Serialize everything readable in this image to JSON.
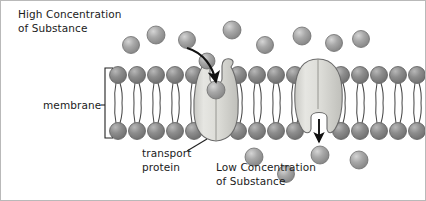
{
  "figure": {
    "width": 426,
    "height": 201,
    "background": "#ffffff",
    "border_color": "#b9b9b9"
  },
  "labels": {
    "high_concentration": "High Concentration\nof Substance",
    "low_concentration": "Low Concentration\nof Substance",
    "membrane": "membrane",
    "transport_protein": "transport\nprotein"
  },
  "colors": {
    "particle_fill": "#9d9d9d",
    "particle_highlight": "#c9c9c9",
    "particle_stroke": "#6f6f6f",
    "head_fill": "#8a8a8a",
    "head_highlight": "#b5b5b5",
    "head_stroke": "#5e5e5e",
    "tail_stroke": "#4a4a4a",
    "protein_fill": "#d6d6d2",
    "protein_highlight": "#e8e8e4",
    "protein_stroke": "#6b6b6b",
    "arrow_color": "#111111",
    "leader_color": "#222222",
    "text_color": "#1b1b1b"
  },
  "membrane": {
    "outer_head_row_y": 74,
    "inner_head_row_y": 130,
    "head_radius": 8.5,
    "left_segment_x": [
      117,
      136,
      155,
      174,
      193
    ],
    "mid_segment_x": [
      237,
      256,
      275,
      294
    ],
    "right_segment_x": [
      340,
      359,
      378,
      397,
      416
    ],
    "bracket": {
      "x": 104,
      "top": 67,
      "bottom": 137,
      "tick_length": 8
    }
  },
  "proteins": [
    {
      "name": "transport-protein-left",
      "center_x": 215,
      "channel_state": "open-top",
      "bound_particle": {
        "x": 215,
        "y": 89,
        "r": 9
      }
    },
    {
      "name": "transport-protein-right",
      "center_x": 317,
      "channel_state": "open-bottom",
      "released_particle": {
        "x": 319,
        "y": 154,
        "r": 9
      }
    }
  ],
  "particles": {
    "above_membrane": [
      {
        "x": 130,
        "y": 44,
        "r": 8.5
      },
      {
        "x": 155,
        "y": 34,
        "r": 9
      },
      {
        "x": 186,
        "y": 39,
        "r": 8.5
      },
      {
        "x": 231,
        "y": 29,
        "r": 9
      },
      {
        "x": 264,
        "y": 44,
        "r": 8.5
      },
      {
        "x": 301,
        "y": 35,
        "r": 9
      },
      {
        "x": 333,
        "y": 42,
        "r": 8.5
      },
      {
        "x": 360,
        "y": 38,
        "r": 8.5
      },
      {
        "x": 206,
        "y": 60,
        "r": 8
      }
    ],
    "below_membrane": [
      {
        "x": 253,
        "y": 156,
        "r": 9
      },
      {
        "x": 285,
        "y": 173,
        "r": 8.5
      },
      {
        "x": 358,
        "y": 159,
        "r": 9
      },
      {
        "x": 319,
        "y": 154,
        "r": 9
      }
    ]
  },
  "arrows": {
    "entry": {
      "name": "substance-entry-arrow",
      "type": "curved",
      "path": "M 186 47 C 202 52 212 66 215 83",
      "direction": "down-into-protein"
    },
    "exit": {
      "name": "substance-exit-arrow",
      "type": "straight",
      "x": 318,
      "y_start": 118,
      "y_end": 143,
      "direction": "down-out-of-protein"
    }
  },
  "leaders": {
    "membrane": {
      "from": [
        100,
        104
      ],
      "to": [
        104,
        104
      ]
    },
    "transport_protein": {
      "from": [
        186,
        150
      ],
      "to": [
        206,
        139
      ]
    }
  }
}
